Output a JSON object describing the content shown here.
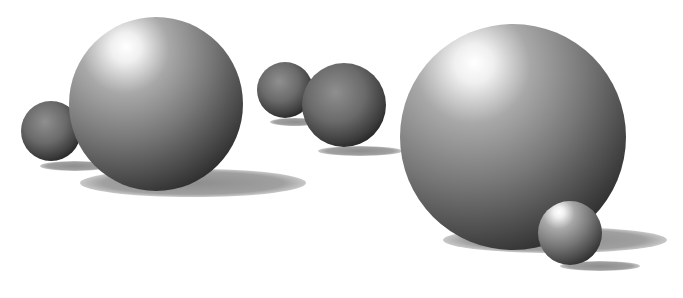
{
  "scene": {
    "description": "Rendered grey shaded spheres with cast shadows on white background",
    "background": "#ffffff",
    "sphere_color_dark": "#2e2e2e",
    "sphere_color_light": "#ffffff",
    "shadow_color": "#9a9a9a",
    "spheres": [
      {
        "name": "small-left-sphere",
        "cx": 51,
        "cy": 131,
        "r": 30
      },
      {
        "name": "large-left-sphere",
        "cx": 156,
        "cy": 104,
        "r": 87
      },
      {
        "name": "small-middle-sphere",
        "cx": 285,
        "cy": 90,
        "r": 28
      },
      {
        "name": "medium-middle-sphere",
        "cx": 344,
        "cy": 105,
        "r": 42
      },
      {
        "name": "large-right-sphere",
        "cx": 513,
        "cy": 137,
        "r": 113
      },
      {
        "name": "small-right-sphere",
        "cx": 570,
        "cy": 233,
        "r": 32
      }
    ],
    "shadows": [
      {
        "name": "small-left-shadow",
        "cx": 75,
        "cy": 166,
        "rx": 35,
        "ry": 5
      },
      {
        "name": "large-left-shadow",
        "cx": 193,
        "cy": 183,
        "rx": 113,
        "ry": 14
      },
      {
        "name": "small-middle-shadow",
        "cx": 295,
        "cy": 122,
        "rx": 25,
        "ry": 4
      },
      {
        "name": "medium-middle-shadow",
        "cx": 360,
        "cy": 151,
        "rx": 42,
        "ry": 5
      },
      {
        "name": "large-right-shadow",
        "cx": 555,
        "cy": 240,
        "rx": 112,
        "ry": 13
      },
      {
        "name": "small-right-shadow",
        "cx": 600,
        "cy": 266,
        "rx": 40,
        "ry": 5
      }
    ]
  }
}
